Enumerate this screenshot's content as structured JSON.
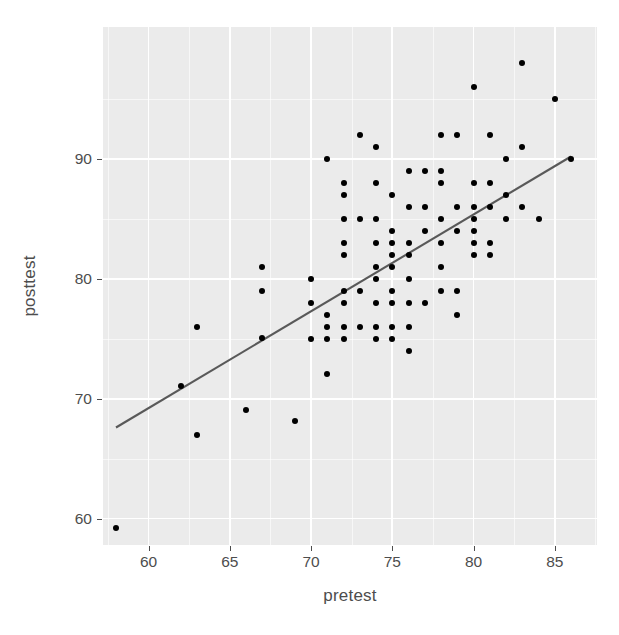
{
  "chart_data": {
    "type": "scatter",
    "title": "",
    "xlabel": "pretest",
    "ylabel": "posttest",
    "xlim": [
      57.2,
      87.6
    ],
    "ylim": [
      57.8,
      101.0
    ],
    "grid": true,
    "legend": null,
    "x_ticks": [
      60,
      65,
      70,
      75,
      80,
      85
    ],
    "y_ticks": [
      60,
      70,
      80,
      90
    ],
    "x_minor_ticks": [
      57.5,
      62.5,
      67.5,
      72.5,
      77.5,
      82.5,
      87.5
    ],
    "y_minor_ticks": [
      65,
      75,
      85,
      95
    ],
    "point_color": "#000000",
    "panel_color": "#ebebeb",
    "grid_color": "#ffffff",
    "fit_line": {
      "type": "linear-regression",
      "color": "#595959",
      "x_start": 58.0,
      "y_start": 67.6,
      "x_end": 86.0,
      "y_end": 90.2
    },
    "points": [
      [
        58,
        59.2
      ],
      [
        62,
        71.1
      ],
      [
        63,
        67.0
      ],
      [
        63,
        76.0
      ],
      [
        66,
        69.1
      ],
      [
        67,
        75.1
      ],
      [
        67,
        81.0
      ],
      [
        67,
        79.0
      ],
      [
        69,
        68.1
      ],
      [
        70,
        80.0
      ],
      [
        70,
        78.0
      ],
      [
        70,
        75.0
      ],
      [
        71,
        90.0
      ],
      [
        71,
        77.0
      ],
      [
        71,
        76.0
      ],
      [
        71,
        75.0
      ],
      [
        71,
        72.1
      ],
      [
        72,
        88.0
      ],
      [
        72,
        87.0
      ],
      [
        72,
        85.0
      ],
      [
        72,
        83.0
      ],
      [
        72,
        82.0
      ],
      [
        72,
        79.0
      ],
      [
        72,
        78.0
      ],
      [
        72,
        76.0
      ],
      [
        72,
        75.0
      ],
      [
        73,
        92.0
      ],
      [
        73,
        85.0
      ],
      [
        73,
        79.0
      ],
      [
        73,
        76.0
      ],
      [
        74,
        91.0
      ],
      [
        74,
        88.0
      ],
      [
        74,
        85.0
      ],
      [
        74,
        83.0
      ],
      [
        74,
        81.0
      ],
      [
        74,
        80.0
      ],
      [
        74,
        78.0
      ],
      [
        74,
        76.0
      ],
      [
        74,
        75.0
      ],
      [
        75,
        87.0
      ],
      [
        75,
        84.0
      ],
      [
        75,
        83.0
      ],
      [
        75,
        82.0
      ],
      [
        75,
        81.0
      ],
      [
        75,
        79.0
      ],
      [
        75,
        78.0
      ],
      [
        75,
        76.0
      ],
      [
        75,
        75.0
      ],
      [
        76,
        89.0
      ],
      [
        76,
        86.0
      ],
      [
        76,
        83.0
      ],
      [
        76,
        82.0
      ],
      [
        76,
        80.0
      ],
      [
        76,
        78.0
      ],
      [
        76,
        76.0
      ],
      [
        76,
        74.0
      ],
      [
        77,
        89.0
      ],
      [
        77,
        86.0
      ],
      [
        77,
        84.0
      ],
      [
        77,
        78.0
      ],
      [
        78,
        92.0
      ],
      [
        78,
        89.0
      ],
      [
        78,
        88.0
      ],
      [
        78,
        85.0
      ],
      [
        78,
        83.0
      ],
      [
        78,
        81.0
      ],
      [
        78,
        79.0
      ],
      [
        79,
        92.0
      ],
      [
        79,
        86.0
      ],
      [
        79,
        84.0
      ],
      [
        79,
        79.0
      ],
      [
        79,
        77.0
      ],
      [
        80,
        96.0
      ],
      [
        80,
        88.0
      ],
      [
        80,
        86.0
      ],
      [
        80,
        85.0
      ],
      [
        80,
        84.0
      ],
      [
        80,
        83.0
      ],
      [
        80,
        82.0
      ],
      [
        81,
        92.0
      ],
      [
        81,
        88.0
      ],
      [
        81,
        86.0
      ],
      [
        81,
        83.0
      ],
      [
        81,
        82.0
      ],
      [
        82,
        90.0
      ],
      [
        82,
        87.0
      ],
      [
        82,
        85.0
      ],
      [
        83,
        98.0
      ],
      [
        83,
        91.0
      ],
      [
        83,
        86.0
      ],
      [
        84,
        85.0
      ],
      [
        85,
        95.0
      ],
      [
        86,
        90.0
      ]
    ]
  }
}
